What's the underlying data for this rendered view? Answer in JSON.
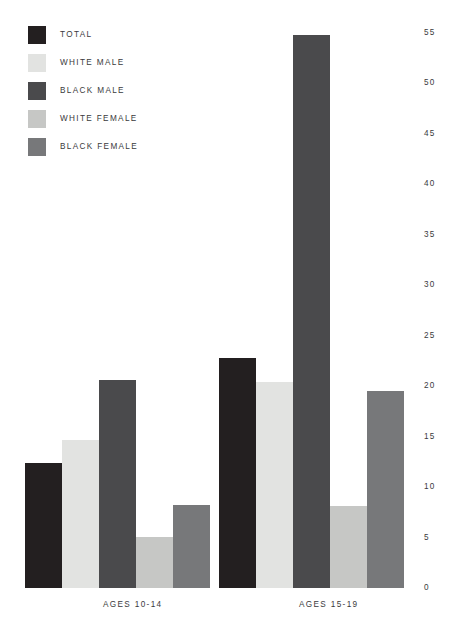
{
  "chart_data": {
    "type": "bar",
    "title": "",
    "subtitle": "",
    "xlabel": "",
    "ylabel": "",
    "categories": [
      "AGES 10-14",
      "AGES 15-19"
    ],
    "ylim": [
      0,
      55
    ],
    "yticks": [
      0,
      5,
      10,
      15,
      20,
      25,
      30,
      35,
      40,
      45,
      50,
      55
    ],
    "ytick_labels": [
      "0",
      "5",
      "10",
      "15",
      "20",
      "25",
      "30",
      "35",
      "40",
      "45",
      "50",
      "55"
    ],
    "grid": false,
    "legend_position": "top-left",
    "series": [
      {
        "name": "TOTAL",
        "color": "#231f20",
        "values": [
          12.4,
          22.8
        ]
      },
      {
        "name": "WHITE MALE",
        "color": "#e2e3e1",
        "values": [
          14.7,
          20.4
        ]
      },
      {
        "name": "BLACK MALE",
        "color": "#4a4a4c",
        "values": [
          20.6,
          54.8
        ]
      },
      {
        "name": "WHITE FEMALE",
        "color": "#c6c7c5",
        "values": [
          5.1,
          8.1
        ]
      },
      {
        "name": "BLACK FEMALE",
        "color": "#77787a",
        "values": [
          8.2,
          19.5
        ]
      }
    ]
  },
  "legend": {
    "items": [
      {
        "label": "TOTAL",
        "color": "#231f20"
      },
      {
        "label": "WHITE MALE",
        "color": "#e2e3e1"
      },
      {
        "label": "BLACK MALE",
        "color": "#4a4a4c"
      },
      {
        "label": "WHITE FEMALE",
        "color": "#c6c7c5"
      },
      {
        "label": "BLACK FEMALE",
        "color": "#77787a"
      }
    ]
  },
  "axis": {
    "y_tick_labels": [
      "55",
      "50",
      "45",
      "40",
      "35",
      "30",
      "25",
      "20",
      "15",
      "10",
      "5",
      "0"
    ],
    "x_group_labels": [
      "AGES 10-14",
      "AGES 15-19"
    ]
  },
  "style": {
    "background": "#ffffff",
    "text_color": "#3a3a3c"
  }
}
